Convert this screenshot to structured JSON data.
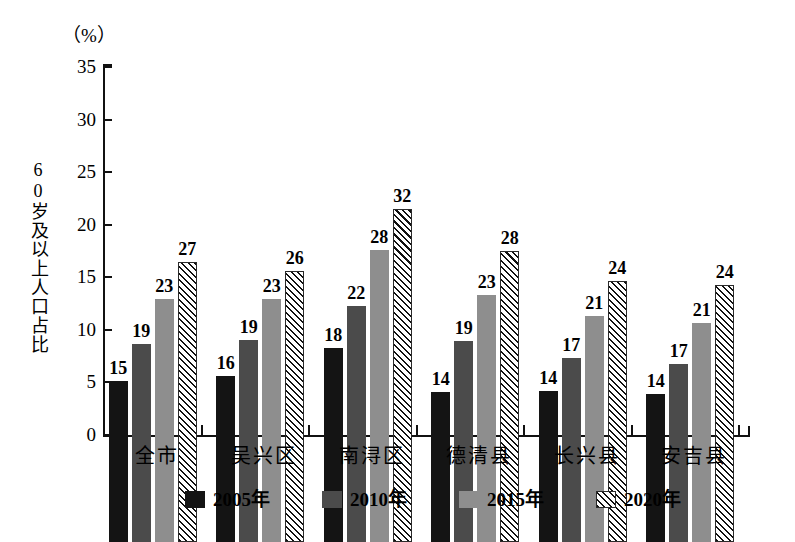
{
  "chart_data": {
    "type": "bar",
    "title": "",
    "subtitle": "",
    "unit_label": "（%）",
    "xlabel": "",
    "ylabel": "60岁及以上人口占比",
    "ylim": [
      0,
      35
    ],
    "yticks": [
      0,
      5,
      10,
      15,
      20,
      25,
      30,
      35
    ],
    "ytick_labels": [
      "0",
      "5",
      "10",
      "15",
      "20",
      "25",
      "30",
      "35"
    ],
    "grid": false,
    "legend_position": "bottom",
    "categories": [
      "全市",
      "吴兴区",
      "南浔区",
      "德清县",
      "长兴县",
      "安吉县"
    ],
    "series": [
      {
        "name": "2005年",
        "color": "#141414",
        "pattern": "solid",
        "values": [
          15,
          16,
          18,
          14,
          14,
          14
        ],
        "plotted": [
          15.3,
          15.8,
          18.5,
          14.3,
          14.4,
          14.1
        ]
      },
      {
        "name": "2010年",
        "color": "#4b4b4b",
        "pattern": "solid",
        "values": [
          19,
          19,
          22,
          19,
          17,
          17
        ],
        "plotted": [
          18.8,
          19.2,
          22.4,
          19.1,
          17.5,
          16.9
        ]
      },
      {
        "name": "2015年",
        "color": "#8e8e8e",
        "pattern": "solid",
        "values": [
          23,
          23,
          28,
          23,
          21,
          21
        ],
        "plotted": [
          23.1,
          23.1,
          27.8,
          23.5,
          21.5,
          20.8
        ]
      },
      {
        "name": "2020年",
        "color": "#ffffff",
        "pattern": "diagonal-hatch",
        "values": [
          27,
          26,
          32,
          28,
          24,
          24
        ],
        "plotted": [
          26.6,
          25.8,
          31.7,
          27.7,
          24.8,
          24.4
        ]
      }
    ]
  },
  "legend": {
    "items": [
      {
        "label": "2005年",
        "swatch": "solid-black"
      },
      {
        "label": "2010年",
        "swatch": "solid-dark-gray"
      },
      {
        "label": "2015年",
        "swatch": "solid-light-gray"
      },
      {
        "label": "2020年",
        "swatch": "diagonal-hatch"
      }
    ]
  }
}
